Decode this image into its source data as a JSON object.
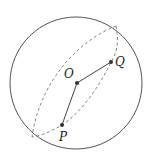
{
  "diagram": {
    "type": "sphere-geometry",
    "colors": {
      "stroke": "#555555",
      "dashed": "#777777",
      "point": "#333333",
      "label": "#222222"
    },
    "sphere": {
      "cx": 76,
      "cy": 83,
      "r": 66
    },
    "points": [
      {
        "id": "O",
        "label": "O",
        "x": 77,
        "y": 83,
        "label_x": 64,
        "label_y": 78
      },
      {
        "id": "Q",
        "label": "Q",
        "x": 111,
        "y": 62,
        "label_x": 115,
        "label_y": 66
      },
      {
        "id": "P",
        "label": "P",
        "x": 62,
        "y": 125,
        "label_x": 59,
        "label_y": 141
      }
    ],
    "segments": [
      {
        "from": "O",
        "to": "Q"
      },
      {
        "from": "O",
        "to": "P"
      }
    ],
    "great_circle_endpoints": {
      "top": {
        "x": 116,
        "y": 26
      },
      "bottom": {
        "x": 32,
        "y": 137
      }
    }
  }
}
